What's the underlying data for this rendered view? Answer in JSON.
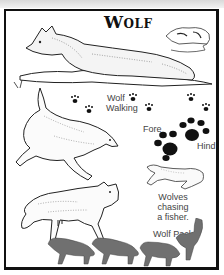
{
  "title": "Wolf",
  "labels": {
    "walking_line1": "Wolf",
    "walking_line2": "Walking",
    "fore": "Fore",
    "hind": "Hind",
    "chasing_line1": "Wolves chasing",
    "chasing_line2": "a fisher.",
    "pack": "Wolf Pack"
  },
  "illustrations": [
    "lying-wolf",
    "wolf-skull",
    "wolf-walking-tracks",
    "fore-and-hind-paw-prints",
    "leaping-wolf",
    "wolf-chasing-fisher",
    "walking-wolf",
    "wolf-pack-silhouettes"
  ],
  "colors": {
    "ink": "#111111",
    "pack_gray": "#6e6e6e",
    "frame": "#111111"
  }
}
